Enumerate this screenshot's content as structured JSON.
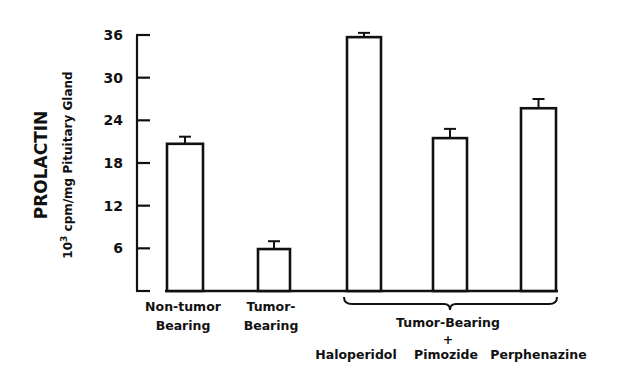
{
  "chart_data": {
    "type": "bar",
    "title": "",
    "ylabel": "PROLACTIN",
    "ylabel_units": "10 3 cpm/mg Pituitary Gland",
    "ylabel_units_parts": {
      "base": "10",
      "sup": "3",
      "rest": "cpm/mg Pituitary Gland"
    },
    "xlabel": "",
    "ylim": [
      0,
      36
    ],
    "yticks": [
      6,
      12,
      18,
      24,
      30,
      36
    ],
    "grid": false,
    "legend": null,
    "categories": [
      "Non-tumor Bearing",
      "Tumor-Bearing",
      "Haloperidol",
      "Pimozide",
      "Perphenazine"
    ],
    "category_label_lines": [
      [
        "Non-tumor",
        "Bearing"
      ],
      [
        "Tumor-",
        "Bearing"
      ],
      [
        "Haloperidol"
      ],
      [
        "Pimozide"
      ],
      [
        "Perphenazine"
      ]
    ],
    "values": [
      20.7,
      5.9,
      35.7,
      21.5,
      25.7
    ],
    "error_upper": [
      1.0,
      1.1,
      0.6,
      1.3,
      1.3
    ],
    "group_annotation": {
      "label": "Tumor-Bearing",
      "connector": "+",
      "spans_categories": [
        "Haloperidol",
        "Pimozide",
        "Perphenazine"
      ]
    },
    "bar_fill": "#ffffff",
    "bar_stroke": "#111111"
  }
}
